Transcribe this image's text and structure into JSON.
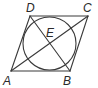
{
  "figure": {
    "type": "geometry",
    "points": {
      "A": {
        "label": "A"
      },
      "B": {
        "label": "B"
      },
      "C": {
        "label": "C"
      },
      "D": {
        "label": "D"
      },
      "E": {
        "label": "E"
      }
    },
    "segments": [
      {
        "from": "A",
        "to": "B"
      },
      {
        "from": "B",
        "to": "C"
      },
      {
        "from": "C",
        "to": "D"
      },
      {
        "from": "D",
        "to": "A"
      },
      {
        "from": "A",
        "to": "C"
      },
      {
        "from": "D",
        "to": "B"
      }
    ],
    "circle": {
      "inscribed_in": "ABCD",
      "center": "E"
    },
    "stroke_color": "#3a3a3a",
    "label_color": "#2a2a2a"
  }
}
